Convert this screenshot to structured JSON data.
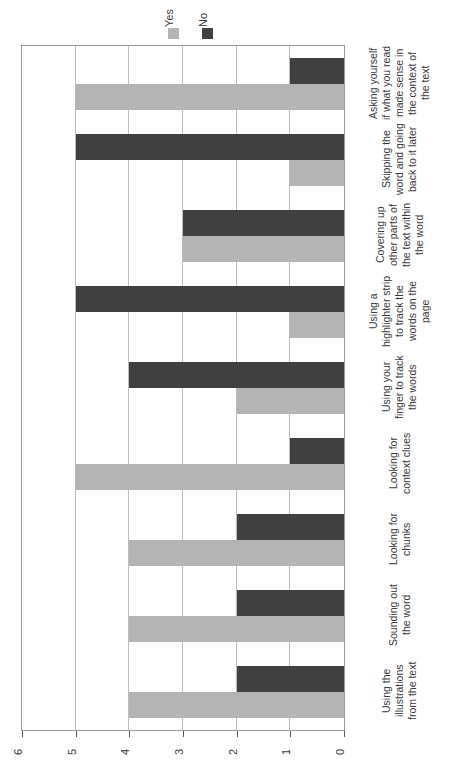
{
  "chart_data": {
    "type": "bar",
    "orientation": "horizontal",
    "title": "",
    "xlabel": "",
    "ylabel": "",
    "xlim": [
      0,
      6
    ],
    "x_axis_reversed": true,
    "x_ticks": [
      "6",
      "5",
      "4",
      "3",
      "2",
      "1",
      "0"
    ],
    "grid": true,
    "legend_position": "top",
    "categories": [
      "Asking yourself if what you read made sense in the context of the text",
      "Skipping the word and going back to it later",
      "Covering up other parts of the text within the word",
      "Using a highlighter strip to track the words on the page",
      "Using your finger to track the words",
      "Looking for context clues",
      "Looking for chunks",
      "Sounding out the word",
      "Using the illustrations from the text"
    ],
    "series": [
      {
        "name": "Yes",
        "color": "#b4b4b4",
        "values": [
          5,
          1,
          3,
          1,
          2,
          5,
          4,
          4,
          4
        ]
      },
      {
        "name": "No",
        "color": "#404040",
        "values": [
          1,
          5,
          3,
          5,
          4,
          1,
          2,
          2,
          2
        ]
      }
    ]
  },
  "legend": {
    "items": [
      {
        "label": "Yes",
        "color": "#b4b4b4"
      },
      {
        "label": "No",
        "color": "#404040"
      }
    ]
  }
}
